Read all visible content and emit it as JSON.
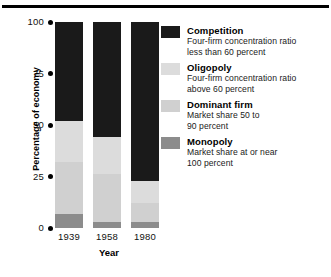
{
  "chart_data": {
    "type": "bar",
    "stacked": true,
    "title": "",
    "xlabel": "Year",
    "ylabel": "Percentage of economy",
    "categories": [
      "1939",
      "1958",
      "1980"
    ],
    "ylim": [
      0,
      100
    ],
    "yticks": [
      "0",
      "25",
      "50",
      "75",
      "100"
    ],
    "ytick_values": [
      0,
      25,
      50,
      75,
      100
    ],
    "grid": false,
    "legend_position": "right",
    "series": [
      {
        "name": "Competition",
        "description_line1": "Four-firm concentration ratio",
        "description_line2": "less than 60 percent",
        "color": "#1a1a1a",
        "values": [
          48,
          56,
          77
        ]
      },
      {
        "name": "Oligopoly",
        "description_line1": "Four-firm concentration ratio",
        "description_line2": "above 60 percent",
        "color": "#dcdcdc",
        "values": [
          20,
          18,
          11
        ]
      },
      {
        "name": "Dominant firm",
        "description_line1": "Market share 50 to",
        "description_line2": "90 percent",
        "color": "#d0d0d0",
        "values": [
          25,
          23,
          9
        ]
      },
      {
        "name": "Monopoly",
        "description_line1": "Market share at or near",
        "description_line2": "100 percent",
        "color": "#8c8c8c",
        "values": [
          7,
          3,
          3
        ]
      }
    ]
  },
  "axes": {
    "y_title": "Percentage of economy",
    "x_title": "Year",
    "y_ticks": [
      {
        "label": "100",
        "value": 100
      },
      {
        "label": "75",
        "value": 75
      },
      {
        "label": "50",
        "value": 50
      },
      {
        "label": "25",
        "value": 25
      },
      {
        "label": "0",
        "value": 0
      }
    ],
    "x_ticks": [
      "1939",
      "1958",
      "1980"
    ]
  },
  "legend": {
    "entries": [
      {
        "label": "Competition",
        "line1": "Four-firm concentration ratio",
        "line2": "less than 60 percent",
        "color": "#1a1a1a"
      },
      {
        "label": "Oligopoly",
        "line1": "Four-firm concentration ratio",
        "line2": "above 60 percent",
        "color": "#dcdcdc"
      },
      {
        "label": "Dominant firm",
        "line1": "Market share 50 to",
        "line2": "90 percent",
        "color": "#d0d0d0"
      },
      {
        "label": "Monopoly",
        "line1": "Market share at or near",
        "line2": "100 percent",
        "color": "#8c8c8c"
      }
    ]
  }
}
